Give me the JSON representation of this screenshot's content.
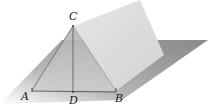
{
  "diagram": {
    "points": {
      "A": {
        "label": "A"
      },
      "B": {
        "label": "B"
      },
      "C": {
        "label": "C"
      },
      "D": {
        "label": "D"
      }
    },
    "segments": [
      "CA",
      "CB",
      "CD",
      "AB"
    ],
    "colors": {
      "plane_dark": "#9a9a9a",
      "plane_light": "#f2f2f2",
      "sheet_face": "#dcdcdc",
      "sheet_front": "#c4c4c4",
      "line": "#555555"
    }
  }
}
